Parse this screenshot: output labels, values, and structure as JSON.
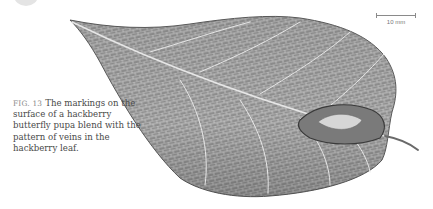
{
  "figure": {
    "label": "FIG. 13",
    "caption": "The markings on the surface of a hackberry butterfly pupa blend with the pattern of veins in the hackberry leaf."
  },
  "scale_bar": {
    "label": "10 mm"
  },
  "colors": {
    "background": "#ffffff",
    "leaf_fill": "#9a9a9a",
    "leaf_dark": "#5c5c5c",
    "vein": "#e2e2e2",
    "caption_text": "#4a4a4a",
    "fig_label": "#888888"
  }
}
